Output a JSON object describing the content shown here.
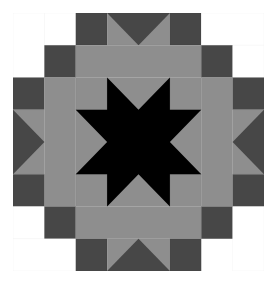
{
  "image": {
    "title": "Quilt block pattern",
    "grid": {
      "cols": 8,
      "rows": 8
    }
  },
  "colors": {
    "white": "#ffffff",
    "dark": "#474747",
    "medium": "#8e8e8e",
    "black": "#000000",
    "line": "#2a2a2a"
  },
  "pieces": [
    {
      "type": "rect",
      "x": 0,
      "y": 0,
      "w": 1,
      "h": 2,
      "color": "white"
    },
    {
      "type": "rect",
      "x": 1,
      "y": 0,
      "w": 1,
      "h": 1,
      "color": "white"
    },
    {
      "type": "rect",
      "x": 2,
      "y": 0,
      "w": 1,
      "h": 1,
      "color": "dark"
    },
    {
      "type": "geese",
      "x": 3,
      "y": 0,
      "w": 2,
      "h": 1,
      "dir": "down"
    },
    {
      "type": "rect",
      "x": 5,
      "y": 0,
      "w": 1,
      "h": 1,
      "color": "dark"
    },
    {
      "type": "rect",
      "x": 6,
      "y": 0,
      "w": 2,
      "h": 1,
      "color": "white"
    },
    {
      "type": "rect",
      "x": 1,
      "y": 1,
      "w": 1,
      "h": 1,
      "color": "dark"
    },
    {
      "type": "rect",
      "x": 2,
      "y": 1,
      "w": 4,
      "h": 1,
      "color": "medium"
    },
    {
      "type": "rect",
      "x": 6,
      "y": 1,
      "w": 1,
      "h": 1,
      "color": "dark"
    },
    {
      "type": "rect",
      "x": 7,
      "y": 1,
      "w": 1,
      "h": 1,
      "color": "white"
    },
    {
      "type": "rect",
      "x": 0,
      "y": 2,
      "w": 1,
      "h": 1,
      "color": "dark"
    },
    {
      "type": "rect",
      "x": 1,
      "y": 2,
      "w": 1,
      "h": 4,
      "color": "medium"
    },
    {
      "type": "rect",
      "x": 6,
      "y": 2,
      "w": 1,
      "h": 4,
      "color": "medium"
    },
    {
      "type": "rect",
      "x": 7,
      "y": 2,
      "w": 1,
      "h": 1,
      "color": "dark"
    },
    {
      "type": "geese",
      "x": 0,
      "y": 3,
      "w": 1,
      "h": 2,
      "dir": "right"
    },
    {
      "type": "geese",
      "x": 7,
      "y": 3,
      "w": 1,
      "h": 2,
      "dir": "left"
    },
    {
      "type": "rect",
      "x": 0,
      "y": 5,
      "w": 1,
      "h": 1,
      "color": "dark"
    },
    {
      "type": "rect",
      "x": 7,
      "y": 5,
      "w": 1,
      "h": 1,
      "color": "dark"
    },
    {
      "type": "rect",
      "x": 0,
      "y": 6,
      "w": 1,
      "h": 1,
      "color": "white"
    },
    {
      "type": "rect",
      "x": 1,
      "y": 6,
      "w": 1,
      "h": 1,
      "color": "dark"
    },
    {
      "type": "rect",
      "x": 2,
      "y": 6,
      "w": 4,
      "h": 1,
      "color": "medium"
    },
    {
      "type": "rect",
      "x": 6,
      "y": 6,
      "w": 1,
      "h": 1,
      "color": "dark"
    },
    {
      "type": "rect",
      "x": 7,
      "y": 6,
      "w": 1,
      "h": 2,
      "color": "white"
    },
    {
      "type": "rect",
      "x": 0,
      "y": 7,
      "w": 2,
      "h": 1,
      "color": "white"
    },
    {
      "type": "rect",
      "x": 2,
      "y": 7,
      "w": 1,
      "h": 1,
      "color": "dark"
    },
    {
      "type": "geese",
      "x": 3,
      "y": 7,
      "w": 2,
      "h": 1,
      "dir": "up"
    },
    {
      "type": "rect",
      "x": 5,
      "y": 7,
      "w": 1,
      "h": 1,
      "color": "dark"
    },
    {
      "type": "star",
      "x": 2,
      "y": 2,
      "w": 4,
      "h": 4
    }
  ]
}
